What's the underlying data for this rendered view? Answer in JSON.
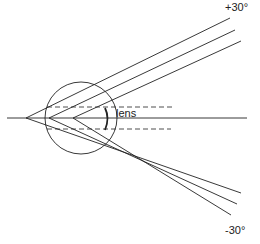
{
  "diagram": {
    "title": "",
    "labels": {
      "top_angle": "+30°",
      "bottom_angle": "-30°",
      "lens": "lens"
    },
    "colors": {
      "stroke": "#222222",
      "background": "#ffffff"
    },
    "elements": {
      "eye_circle": {
        "cx": 81,
        "cy": 118,
        "r": 36
      },
      "optical_axis": {
        "x1": 7,
        "y1": 118,
        "x2": 247,
        "y2": 118
      },
      "apexes": [
        {
          "x": 26,
          "y": 118
        },
        {
          "x": 49,
          "y": 118
        },
        {
          "x": 73,
          "y": 118
        }
      ],
      "upper_rays_end": [
        {
          "x": 230,
          "y": 18
        },
        {
          "x": 235,
          "y": 30
        },
        {
          "x": 241,
          "y": 41
        }
      ],
      "lower_rays_end": [
        {
          "x": 241,
          "y": 193
        },
        {
          "x": 237,
          "y": 204
        },
        {
          "x": 231,
          "y": 215
        }
      ],
      "dashed_lines": [
        {
          "x1": 47,
          "y1": 107,
          "x2": 175,
          "y2": 107
        },
        {
          "x1": 47,
          "y1": 129,
          "x2": 171,
          "y2": 129
        }
      ]
    }
  }
}
